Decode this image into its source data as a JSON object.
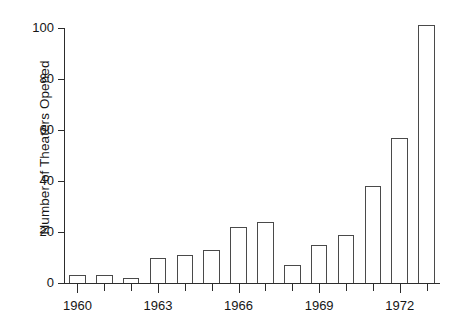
{
  "chart_data": {
    "type": "bar",
    "title": "",
    "xlabel": "",
    "ylabel": "Number of Theaters Opened",
    "categories": [
      1960,
      1961,
      1962,
      1963,
      1964,
      1965,
      1966,
      1967,
      1968,
      1969,
      1970,
      1971,
      1972,
      1973
    ],
    "values": [
      3,
      3,
      2,
      10,
      11,
      13,
      22,
      24,
      7,
      15,
      19,
      38,
      57,
      101
    ],
    "xlim": [
      1959.5,
      1973.5
    ],
    "ylim": [
      0,
      100
    ],
    "yticks": [
      0,
      20,
      40,
      60,
      80,
      100
    ],
    "ytick_labels": [
      "0",
      "20",
      "40",
      "60",
      "80",
      "100"
    ],
    "xticks": [
      1960,
      1961,
      1962,
      1963,
      1964,
      1965,
      1966,
      1967,
      1968,
      1969,
      1970,
      1971,
      1972,
      1973
    ],
    "xtick_labels_shown": [
      "1960",
      "1963",
      "1966",
      "1969",
      "1972"
    ],
    "xtick_labeled_years": [
      1960,
      1963,
      1966,
      1969,
      1972
    ],
    "grid": false,
    "legend": null,
    "bar_fill_color": "#ffffff",
    "bar_edge_color": "#4a4a4a",
    "axis_color": "#2c2c2c",
    "background_color": "#ffffff"
  }
}
